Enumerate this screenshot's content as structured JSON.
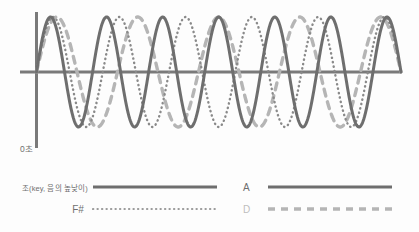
{
  "figure": {
    "background_color": "#fdfdfd",
    "time_origin_label": "0초"
  },
  "axes": {
    "color": "#7a7a7a",
    "x_axis_label": "",
    "y_axis_label": ""
  },
  "legend": {
    "entries": [
      {
        "label": "조(key, 음의 높낮이)",
        "style": "solid",
        "color": "#6e6e6e",
        "label_color": "#6f6f6f"
      },
      {
        "label": "F#",
        "style": "dotted",
        "color": "#8a8a8a",
        "label_color": "#6f6f6f"
      },
      {
        "label": "A",
        "style": "solid",
        "color": "#6e6e6e",
        "label_color": "#6f6f6f"
      },
      {
        "label": "D",
        "style": "dashed",
        "color": "#b5b5b5",
        "label_color": "#bdbdbd"
      }
    ]
  },
  "chart_data": {
    "type": "line",
    "title": "",
    "subtitle": "",
    "xlabel": "0초",
    "ylabel": "",
    "grid": false,
    "legend_position": "bottom",
    "xlim": [
      0,
      1
    ],
    "ylim": [
      -1.25,
      1.25
    ],
    "x_axis_position": 0,
    "annotations": [
      "0초"
    ],
    "series": [
      {
        "name": "조(key, 음의 높낮이)",
        "style": "solid",
        "color": "#6e6e6e",
        "cycles": 6.5,
        "amplitude": 1.0,
        "phase_deg": 0,
        "linewidth": 3.0
      },
      {
        "name": "F#",
        "style": "dotted",
        "color": "#8a8a8a",
        "cycles": 5.5,
        "amplitude": 1.0,
        "phase_deg": 0,
        "linewidth": 2.4
      },
      {
        "name": "A",
        "style": "solid",
        "color": "#6e6e6e",
        "cycles": 6.5,
        "amplitude": 1.0,
        "phase_deg": 0,
        "linewidth": 3.0
      },
      {
        "name": "D",
        "style": "dashed",
        "color": "#b5b5b5",
        "cycles": 4.5,
        "amplitude": 1.0,
        "phase_deg": 0,
        "linewidth": 3.4
      }
    ]
  }
}
